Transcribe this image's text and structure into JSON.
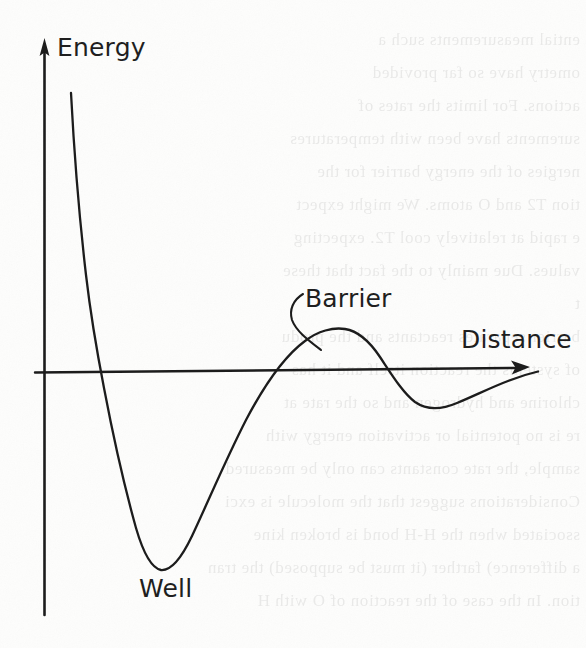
{
  "figure": {
    "kind": "line-art-diagram",
    "medium": "scanned book page, black ink on white paper",
    "background_color": "#fdfdfc",
    "ink_color": "#1c1c1c",
    "axes": {
      "y_axis": {
        "label": "Energy",
        "arrow": "up",
        "name": "energy-axis"
      },
      "x_axis": {
        "label": "Distance",
        "arrow": "right",
        "name": "distance-axis"
      }
    },
    "annotations": [
      {
        "id": "barrier",
        "label": "Barrier",
        "has_leader_line": true
      },
      {
        "id": "well",
        "label": "Well",
        "has_leader_line": false
      }
    ],
    "ghost_text_lines": [
      "ential measurements such a",
      "ometry have so far provided",
      "actions. For limits the rates of",
      "surements have been with temperatures",
      "nergies of the energy barrier for the",
      "tion  T2 and O atoms. We might expect",
      "e rapid at relatively cool T2. expecting",
      "values. Due mainly to the fact that these",
      "t",
      "barrier separates reactants and the produ",
      "of systems the reaction itself and it has",
      "chlorine and hydrogen and so the rate at",
      "re is no potential or activation energy with",
      "sample, the rate constants can only be measured",
      "Considerations suggest that the molecule is exci",
      "ssociated when the H-H bond is broken kine",
      "a difference) farther (it must be supposed) the tran",
      "tion. In the case of the reaction of O with H"
    ]
  },
  "chart_data": {
    "type": "line",
    "title": "",
    "xlabel": "Distance",
    "ylabel": "Energy",
    "grid": false,
    "legend": null,
    "axis_style": "arrow-terminated, unlabeled ticks, zero line only",
    "xlim": [
      0,
      10
    ],
    "ylim": [
      -2,
      10
    ],
    "annotations": [
      {
        "text": "Barrier",
        "x": 5.4,
        "y": 1.35,
        "points_to": {
          "x": 4.75,
          "y": 0.45
        }
      },
      {
        "text": "Well",
        "x": 1.95,
        "y": -4.1,
        "points_to": {
          "x": 1.9,
          "y": -3.55
        }
      }
    ],
    "features": [
      {
        "name": "repulsive-wall-top",
        "x": 0.45,
        "y": 9.4
      },
      {
        "name": "zero-crossing-rising-from-wall",
        "x": 0.95,
        "y": 0
      },
      {
        "name": "well-minimum",
        "x": 1.9,
        "y": -3.55
      },
      {
        "name": "zero-crossing-ascending",
        "x": 4.45,
        "y": 0
      },
      {
        "name": "barrier-maximum",
        "x": 5.35,
        "y": 1.05
      },
      {
        "name": "zero-crossing-descending",
        "x": 6.3,
        "y": 0
      },
      {
        "name": "secondary-shallow-minimum",
        "x": 7.6,
        "y": -0.55
      },
      {
        "name": "asymptote-return-to-zero",
        "x": 9.6,
        "y": -0.02
      }
    ],
    "x": [
      0.42,
      0.5,
      0.58,
      0.66,
      0.74,
      0.82,
      0.9,
      0.98,
      1.1,
      1.25,
      1.4,
      1.55,
      1.7,
      1.9,
      2.1,
      2.3,
      2.55,
      2.8,
      3.1,
      3.4,
      3.7,
      4.0,
      4.25,
      4.45,
      4.7,
      5.0,
      5.35,
      5.65,
      5.95,
      6.3,
      6.65,
      7.0,
      7.3,
      7.6,
      8.0,
      8.4,
      8.8,
      9.2,
      9.6
    ],
    "y": [
      9.4,
      7.8,
      6.3,
      5.0,
      3.8,
      2.7,
      1.6,
      0.55,
      -0.7,
      -1.9,
      -2.75,
      -3.25,
      -3.5,
      -3.55,
      -3.4,
      -3.1,
      -2.6,
      -2.05,
      -1.4,
      -0.9,
      -0.5,
      -0.18,
      0.0,
      0.1,
      0.55,
      0.92,
      1.05,
      0.95,
      0.6,
      0.0,
      -0.32,
      -0.5,
      -0.55,
      -0.55,
      -0.48,
      -0.35,
      -0.22,
      -0.1,
      -0.02
    ]
  },
  "labels": {
    "energy": "Energy",
    "distance": "Distance",
    "barrier": "Barrier",
    "well": "Well"
  }
}
